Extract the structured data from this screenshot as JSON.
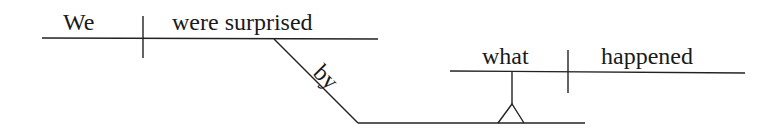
{
  "diagram": {
    "type": "Reed-Kellogg sentence diagram",
    "sentence": "We were surprised by what happened",
    "main_clause": {
      "subject": "We",
      "predicate": "were surprised"
    },
    "preposition": "by",
    "object_clause": {
      "subject": "what",
      "predicate": "happened"
    },
    "colors": {
      "line": "#222222",
      "text": "#1a1a1a",
      "background": "#ffffff"
    }
  }
}
